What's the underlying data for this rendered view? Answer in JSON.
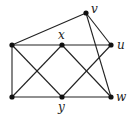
{
  "diagram": {
    "type": "graph",
    "nodes": [
      {
        "id": "a",
        "label": "",
        "x": 12,
        "y": 45
      },
      {
        "id": "x",
        "label": "x",
        "x": 62,
        "y": 45
      },
      {
        "id": "u",
        "label": "u",
        "x": 111,
        "y": 45
      },
      {
        "id": "v",
        "label": "v",
        "x": 86,
        "y": 13
      },
      {
        "id": "b",
        "label": "",
        "x": 12,
        "y": 97
      },
      {
        "id": "y",
        "label": "y",
        "x": 62,
        "y": 97
      },
      {
        "id": "w",
        "label": "w",
        "x": 111,
        "y": 97
      }
    ],
    "edges": [
      [
        "a",
        "v"
      ],
      [
        "a",
        "x"
      ],
      [
        "x",
        "u"
      ],
      [
        "a",
        "b"
      ],
      [
        "b",
        "y"
      ],
      [
        "y",
        "w"
      ],
      [
        "a",
        "y"
      ],
      [
        "x",
        "b"
      ],
      [
        "x",
        "w"
      ],
      [
        "y",
        "u"
      ],
      [
        "v",
        "u"
      ],
      [
        "v",
        "w"
      ]
    ],
    "labels": {
      "x": "x",
      "u": "u",
      "v": "v",
      "y": "y",
      "w": "w"
    },
    "colors": {
      "stroke": "#222222",
      "node": "#111111"
    }
  }
}
